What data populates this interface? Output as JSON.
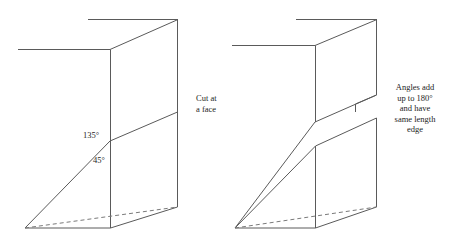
{
  "figure": {
    "background_color": "#ffffff",
    "line_color": "#5a5a5a",
    "dash_color": "#7a7a7a",
    "width": 449,
    "height": 241
  },
  "panels": [
    {
      "id": "left",
      "name": "cut-at-a-face",
      "caption": "Cut at\na face",
      "angle_labels": [
        {
          "name": "angle-135",
          "value": "135°"
        },
        {
          "name": "angle-45",
          "value": "45°"
        }
      ]
    },
    {
      "id": "right",
      "name": "angles-add-to-180",
      "caption": "Angles add\nup to 180°\nand have\nsame length\nedge",
      "angle_labels": []
    }
  ]
}
